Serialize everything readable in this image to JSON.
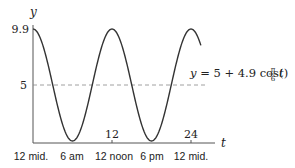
{
  "chart_data": {
    "type": "line",
    "title": "",
    "xlabel": "t",
    "ylabel": "y",
    "equation_label": "y = 5 + 4.9 cos(π/6 t)",
    "function": {
      "A": 5,
      "B": 4.9,
      "omega": "pi/6"
    },
    "xlim": [
      0,
      26
    ],
    "ylim": [
      0,
      10.5
    ],
    "x_ticks": [
      {
        "value": 12,
        "label": "12"
      },
      {
        "value": 24,
        "label": "24"
      }
    ],
    "y_ticks": [
      {
        "value": 9.9,
        "label": "9.9"
      },
      {
        "value": 5,
        "label": "5"
      }
    ],
    "time_labels": [
      {
        "t": 0,
        "label": "12 mid."
      },
      {
        "t": 6,
        "label": "6 am"
      },
      {
        "t": 12,
        "label": "12 noon"
      },
      {
        "t": 18,
        "label": "6 pm"
      },
      {
        "t": 24,
        "label": "12 mid."
      }
    ],
    "reference_line": {
      "y": 5,
      "style": "dashed"
    },
    "grid": false,
    "series": [
      {
        "name": "y = 5 + 4.9cos(πt/6)",
        "x": [
          0,
          3,
          6,
          9,
          12,
          15,
          18,
          21,
          24,
          25.5
        ],
        "values": [
          9.9,
          5,
          0.1,
          5,
          9.9,
          5,
          0.1,
          5,
          9.9,
          8.46
        ]
      }
    ]
  },
  "labels": {
    "y_axis": "y",
    "x_axis": "t",
    "y_9_9": "9.9",
    "y_5": "5",
    "x_12": "12",
    "x_24": "24",
    "eq_prefix": "y = 5 + 4.9 cos(",
    "eq_frac_num": "π",
    "eq_frac_den": "6",
    "eq_suffix": "t)",
    "time_0": "12 mid.",
    "time_6": "6 am",
    "time_12": "12 noon",
    "time_18": "6 pm",
    "time_24": "12 mid."
  },
  "colors": {
    "curve": "#333333",
    "axes": "#555555",
    "dashed": "#888888",
    "text": "#222222"
  }
}
